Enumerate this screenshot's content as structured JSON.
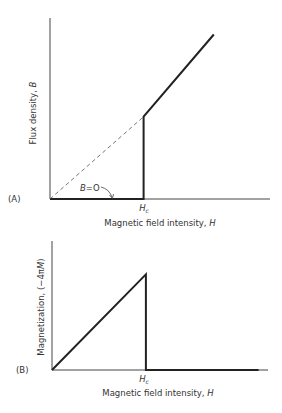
{
  "figure": {
    "panels": [
      {
        "id": "A",
        "label": "(A)",
        "ylabel_text": "Flux density, ",
        "ylabel_var": "B",
        "xlabel_text": "Magnetic field intensity, ",
        "xlabel_var": "H",
        "tick_label": "Hc",
        "tick_main": "H",
        "tick_sub": "c",
        "annotation": "B=O"
      },
      {
        "id": "B",
        "label": "(B)",
        "ylabel_text": "Magnetization, (−4π",
        "ylabel_var": "M",
        "ylabel_end": ")",
        "xlabel_text": "Magnetic field intensity, ",
        "xlabel_var": "H",
        "tick_label": "Hc",
        "tick_main": "H",
        "tick_sub": "c"
      }
    ]
  },
  "chart_data": [
    {
      "type": "line",
      "title": "(A)",
      "xlabel": "Magnetic field intensity, H",
      "ylabel": "Flux density, B",
      "x_ticks": [
        "Hc"
      ],
      "annotation": "B=O",
      "series": [
        {
          "name": "B (superconducting)",
          "style": "solid",
          "points": [
            [
              0,
              0
            ],
            [
              1,
              0
            ],
            [
              1,
              1
            ],
            [
              1.75,
              2
            ]
          ]
        },
        {
          "name": "B = H (normal)",
          "style": "dashed",
          "points": [
            [
              0,
              0
            ],
            [
              1,
              1
            ]
          ]
        }
      ],
      "xlim": [
        0,
        2.35
      ],
      "ylim": [
        0,
        2.2
      ]
    },
    {
      "type": "line",
      "title": "(B)",
      "xlabel": "Magnetic field intensity, H",
      "ylabel": "Magnetization, (−4πM)",
      "x_ticks": [
        "Hc"
      ],
      "series": [
        {
          "name": "-4πM",
          "style": "solid",
          "points": [
            [
              0,
              0
            ],
            [
              1,
              1
            ],
            [
              1,
              0
            ],
            [
              2.2,
              0
            ]
          ]
        }
      ],
      "xlim": [
        0,
        2.3
      ],
      "ylim": [
        0,
        1.35
      ]
    }
  ]
}
